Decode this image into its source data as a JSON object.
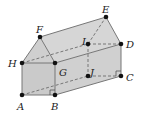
{
  "diagram": {
    "type": "3d-prism-house-shape",
    "colors": {
      "face_fill": "#d4d4d4",
      "face_front": "#cfcfcf",
      "edge": "#777777",
      "hidden_edge": "#777777",
      "point": "#111111",
      "label": "#222222"
    },
    "points": {
      "A": {
        "x": 22,
        "y": 95
      },
      "B": {
        "x": 55,
        "y": 95
      },
      "G": {
        "x": 55,
        "y": 63
      },
      "H": {
        "x": 22,
        "y": 63
      },
      "F": {
        "x": 40,
        "y": 37
      },
      "E": {
        "x": 106,
        "y": 17
      },
      "D": {
        "x": 121,
        "y": 44
      },
      "C": {
        "x": 121,
        "y": 76
      },
      "I": {
        "x": 88,
        "y": 44
      },
      "J": {
        "x": 88,
        "y": 76
      }
    },
    "labels": {
      "A": "A",
      "B": "B",
      "C": "C",
      "D": "D",
      "E": "E",
      "F": "F",
      "G": "G",
      "H": "H",
      "I": "I",
      "J": "J"
    },
    "right_angle_marks": [
      "B",
      "C"
    ]
  }
}
